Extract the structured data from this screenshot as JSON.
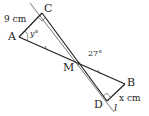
{
  "diagram": {
    "points": {
      "A": {
        "label": "A"
      },
      "B": {
        "label": "B"
      },
      "C": {
        "label": "C"
      },
      "D": {
        "label": "D"
      },
      "M": {
        "label": "M"
      }
    },
    "line_label": "l",
    "measurements": {
      "AC": "9 cm",
      "BD": "x cm",
      "angle_CAM": "y°",
      "angle_BMD": "27°"
    },
    "colors": {
      "stroke": "#222222",
      "background": "#ffffff"
    }
  }
}
